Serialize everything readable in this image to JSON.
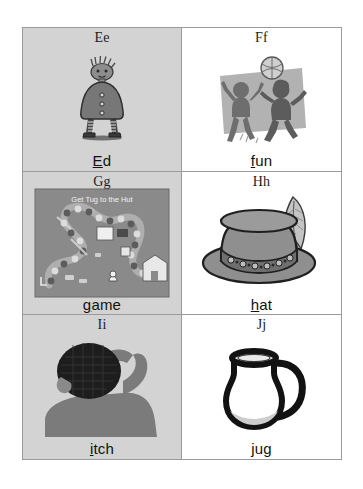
{
  "chart": {
    "title_visible": false,
    "rows": 3,
    "columns": 2,
    "border_color": "#9a9a9a",
    "shaded_cell_color": "#d3d3d3",
    "plain_cell_color": "#ffffff"
  },
  "cells": [
    {
      "letter_pair": "Ee",
      "word_initial": "E",
      "word_rest": "d",
      "word_full": "Ed",
      "background": "shaded",
      "illustration": "boy-character-ed"
    },
    {
      "letter_pair": "Ff",
      "word_initial": "f",
      "word_rest": "un",
      "word_full": "fun",
      "background": "plain",
      "illustration": "children-playing-ball"
    },
    {
      "letter_pair": "Gg",
      "word_initial": "g",
      "word_rest": "ame",
      "word_full": "game",
      "background": "shaded",
      "illustration": "board-game"
    },
    {
      "letter_pair": "Hh",
      "word_initial": "h",
      "word_rest": "at",
      "word_full": "hat",
      "background": "plain",
      "illustration": "hat-with-feather"
    },
    {
      "letter_pair": "Ii",
      "word_initial": "i",
      "word_rest": "tch",
      "word_full": "itch",
      "background": "shaded",
      "illustration": "person-scratching-head"
    },
    {
      "letter_pair": "Jj",
      "word_initial": "j",
      "word_rest": "ug",
      "word_full": "jug",
      "background": "plain",
      "illustration": "jug-pitcher"
    }
  ],
  "board_game": {
    "caption": "Get Tug to the Hut"
  }
}
